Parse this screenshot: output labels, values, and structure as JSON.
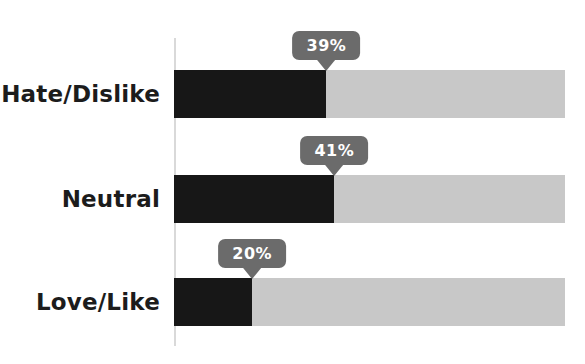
{
  "chart_data": {
    "type": "bar",
    "orientation": "horizontal",
    "title": "",
    "xlabel": "",
    "ylabel": "",
    "xlim": [
      0,
      100
    ],
    "grid": false,
    "legend": "none",
    "categories": [
      "Hate/Dislike",
      "Neutral",
      "Love/Like"
    ],
    "values": [
      39,
      41,
      20
    ],
    "value_labels": [
      "39%",
      "41%",
      "20%"
    ],
    "annotations": "percentage shown in tooltip callout at end of each filled bar segment",
    "colors": {
      "bg": "#ffffff",
      "fill": "#171717",
      "track": "#c8c8c8",
      "tip_bg": "#6b6b6b",
      "tip_text": "#ffffff",
      "label": "#1c1c1c",
      "axis": "#d9d9d9"
    }
  }
}
